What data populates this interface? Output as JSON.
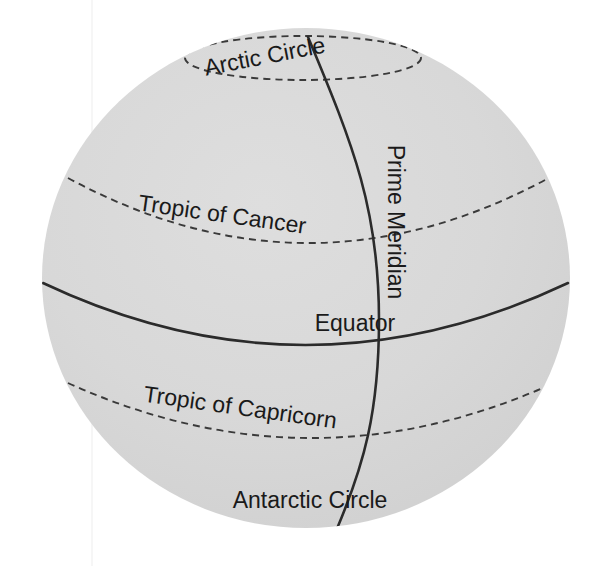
{
  "figure": {
    "width": 603,
    "height": 566
  },
  "colors": {
    "background": "#ffffff",
    "sphere_fill": "#d4d4d4",
    "sphere_fill_light": "#dcdcdc",
    "line": "#2b2b2b",
    "dashed_line": "#3a3a3a",
    "label_text": "#1a1a1a",
    "seam": "#ededed"
  },
  "geometry": {
    "sphere": {
      "cx": 306,
      "cy": 278,
      "rx": 264,
      "ry": 250
    },
    "arctic_circle_ellipse": {
      "cx": 303,
      "cy": 58,
      "rx": 118,
      "ry": 22
    },
    "tropic_cancer_arc": {
      "x1": 68,
      "y1": 178,
      "x2": 545,
      "y2": 180,
      "sag": 64
    },
    "equator_arc": {
      "x1": 43,
      "y1": 283,
      "x2": 568,
      "y2": 283,
      "sag": 62
    },
    "tropic_capricorn_arc": {
      "x1": 68,
      "y1": 383,
      "x2": 545,
      "y2": 387,
      "sag": 53
    },
    "prime_meridian": {
      "x_top": 308,
      "y_top": 37,
      "x_mid": 379,
      "y_mid": 320,
      "x_bottom": 336,
      "y_bottom": 531
    }
  },
  "labels": {
    "arctic_circle": {
      "text": "Arctic Circle",
      "x": 265,
      "y": 58,
      "rotation": -11,
      "font_size": 23
    },
    "tropic_of_cancer": {
      "text": "Tropic of Cancer",
      "x": 222,
      "y": 216,
      "rotation": 8,
      "font_size": 23
    },
    "prime_meridian": {
      "text": "Prime Meridian",
      "x": 394,
      "y": 222,
      "rotation": 90,
      "font_size": 23
    },
    "equator": {
      "text": "Equator",
      "x": 355,
      "y": 325,
      "rotation": 0,
      "font_size": 23
    },
    "tropic_of_capricorn": {
      "text": "Tropic of Capricorn",
      "x": 240,
      "y": 409,
      "rotation": 8,
      "font_size": 23
    },
    "antarctic_circle": {
      "text": "Antarctic Circle",
      "x": 310,
      "y": 502,
      "rotation": 0,
      "font_size": 23
    }
  },
  "chart_data": {
    "type": "diagram",
    "projection": "orthographic-style perspective sphere",
    "features": [
      {
        "name": "Arctic Circle",
        "kind": "latitude-circle",
        "latitude_deg": 66.5,
        "hemisphere": "north",
        "style": "dashed",
        "label": "Arctic Circle",
        "fully_visible": true
      },
      {
        "name": "Tropic of Cancer",
        "kind": "latitude-circle",
        "latitude_deg": 23.5,
        "hemisphere": "north",
        "style": "dashed",
        "label": "Tropic of Cancer",
        "fully_visible": false
      },
      {
        "name": "Equator",
        "kind": "latitude-circle",
        "latitude_deg": 0,
        "hemisphere": "none",
        "style": "solid",
        "label": "Equator",
        "fully_visible": false
      },
      {
        "name": "Tropic of Capricorn",
        "kind": "latitude-circle",
        "latitude_deg": -23.5,
        "hemisphere": "south",
        "style": "dashed",
        "label": "Tropic of Capricorn",
        "fully_visible": false
      },
      {
        "name": "Antarctic Circle",
        "kind": "latitude-circle",
        "latitude_deg": -66.5,
        "hemisphere": "south",
        "style": "dashed",
        "label": "Antarctic Circle",
        "fully_visible": false
      },
      {
        "name": "Prime Meridian",
        "kind": "longitude-line",
        "longitude_deg": 0,
        "style": "solid",
        "label": "Prime Meridian",
        "fully_visible": true
      }
    ],
    "labels": [
      "Arctic Circle",
      "Tropic of Cancer",
      "Prime Meridian",
      "Equator",
      "Tropic of Capricorn",
      "Antarctic Circle"
    ]
  }
}
